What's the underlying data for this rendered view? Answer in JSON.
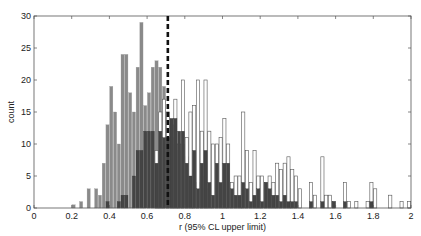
{
  "chart_data": {
    "type": "bar",
    "subtype": "overlaid-histogram",
    "title": "",
    "xlabel": "r (95% CL upper limit)",
    "ylabel": "count",
    "xlim": [
      0,
      2
    ],
    "ylim": [
      0,
      30
    ],
    "xticks": [
      0,
      0.2,
      0.4,
      0.6,
      0.8,
      1,
      1.2,
      1.4,
      1.6,
      1.8,
      2
    ],
    "xtick_labels": [
      "0",
      "0.2",
      "0.4",
      "0.6",
      "0.8",
      "1",
      "1.2",
      "1.4",
      "1.6",
      "1.8",
      "2"
    ],
    "yticks": [
      0,
      5,
      10,
      15,
      20,
      25,
      30
    ],
    "ytick_labels": [
      "0",
      "5",
      "10",
      "15",
      "20",
      "25",
      "30"
    ],
    "bin_width": 0.02,
    "grid": false,
    "vline": {
      "x": 0.71,
      "style": "dashed",
      "color": "#111111"
    },
    "series": [
      {
        "name": "light-gray",
        "color": "#8a8a8a",
        "bins": [
          [
            0.2,
            0.5
          ],
          [
            0.24,
            1
          ],
          [
            0.28,
            3
          ],
          [
            0.32,
            3
          ],
          [
            0.34,
            2
          ],
          [
            0.36,
            7
          ],
          [
            0.38,
            13
          ],
          [
            0.4,
            19
          ],
          [
            0.42,
            15
          ],
          [
            0.44,
            10
          ],
          [
            0.46,
            24
          ],
          [
            0.48,
            24
          ],
          [
            0.5,
            18
          ],
          [
            0.52,
            15
          ],
          [
            0.54,
            22
          ],
          [
            0.56,
            29
          ],
          [
            0.58,
            16
          ],
          [
            0.6,
            18
          ],
          [
            0.62,
            22
          ],
          [
            0.64,
            23
          ],
          [
            0.66,
            22
          ],
          [
            0.68,
            19
          ],
          [
            0.7,
            15
          ],
          [
            0.72,
            11
          ],
          [
            0.74,
            10
          ],
          [
            0.76,
            9
          ],
          [
            0.78,
            10
          ],
          [
            0.8,
            8
          ],
          [
            0.82,
            6
          ],
          [
            0.84,
            5
          ],
          [
            0.86,
            4
          ],
          [
            0.88,
            5
          ],
          [
            0.9,
            3
          ]
        ]
      },
      {
        "name": "white-outline",
        "color": "#ffffff",
        "bins": [
          [
            0.64,
            9
          ],
          [
            0.66,
            15
          ],
          [
            0.68,
            17
          ],
          [
            0.7,
            15
          ],
          [
            0.72,
            13
          ],
          [
            0.74,
            17
          ],
          [
            0.76,
            10
          ],
          [
            0.78,
            20
          ],
          [
            0.8,
            11
          ],
          [
            0.82,
            15
          ],
          [
            0.84,
            16
          ],
          [
            0.86,
            20
          ],
          [
            0.88,
            12
          ],
          [
            0.9,
            20
          ],
          [
            0.92,
            12
          ],
          [
            0.94,
            10
          ],
          [
            0.96,
            10
          ],
          [
            0.98,
            11
          ],
          [
            1.0,
            14
          ],
          [
            1.02,
            10
          ],
          [
            1.04,
            4
          ],
          [
            1.06,
            5
          ],
          [
            1.08,
            5
          ],
          [
            1.1,
            15
          ],
          [
            1.12,
            9
          ],
          [
            1.14,
            4
          ],
          [
            1.16,
            9
          ],
          [
            1.18,
            5
          ],
          [
            1.2,
            5
          ],
          [
            1.22,
            4
          ],
          [
            1.24,
            5
          ],
          [
            1.26,
            4
          ],
          [
            1.28,
            7
          ],
          [
            1.3,
            6
          ],
          [
            1.32,
            7
          ],
          [
            1.34,
            8
          ],
          [
            1.36,
            6
          ],
          [
            1.38,
            5
          ],
          [
            1.4,
            3
          ],
          [
            1.46,
            4
          ],
          [
            1.48,
            2
          ],
          [
            1.52,
            8
          ],
          [
            1.54,
            2
          ],
          [
            1.56,
            2
          ],
          [
            1.58,
            1
          ],
          [
            1.64,
            4
          ],
          [
            1.66,
            1
          ],
          [
            1.7,
            1
          ],
          [
            1.76,
            1
          ],
          [
            1.78,
            4
          ],
          [
            1.8,
            3
          ],
          [
            1.88,
            2
          ],
          [
            1.94,
            1
          ],
          [
            1.98,
            1
          ]
        ]
      },
      {
        "name": "dark-gray",
        "color": "#444444",
        "bins": [
          [
            0.38,
            1
          ],
          [
            0.44,
            1
          ],
          [
            0.46,
            2
          ],
          [
            0.48,
            2
          ],
          [
            0.52,
            5
          ],
          [
            0.54,
            9
          ],
          [
            0.56,
            9
          ],
          [
            0.58,
            12
          ],
          [
            0.6,
            12
          ],
          [
            0.62,
            12
          ],
          [
            0.64,
            7
          ],
          [
            0.66,
            12
          ],
          [
            0.68,
            11
          ],
          [
            0.7,
            11
          ],
          [
            0.72,
            14
          ],
          [
            0.74,
            14
          ],
          [
            0.76,
            12
          ],
          [
            0.78,
            12
          ],
          [
            0.8,
            7
          ],
          [
            0.82,
            5
          ],
          [
            0.84,
            9
          ],
          [
            0.86,
            3
          ],
          [
            0.88,
            7
          ],
          [
            0.9,
            9
          ],
          [
            0.92,
            4
          ],
          [
            0.94,
            2
          ],
          [
            0.96,
            7
          ],
          [
            0.98,
            4
          ],
          [
            1.0,
            7
          ],
          [
            1.02,
            7
          ],
          [
            1.04,
            3
          ],
          [
            1.06,
            2
          ],
          [
            1.08,
            2
          ],
          [
            1.1,
            4
          ],
          [
            1.12,
            3
          ],
          [
            1.14,
            1
          ],
          [
            1.16,
            2
          ],
          [
            1.18,
            3
          ],
          [
            1.2,
            1
          ],
          [
            1.22,
            4
          ],
          [
            1.24,
            3
          ],
          [
            1.26,
            2
          ],
          [
            1.28,
            2
          ],
          [
            1.3,
            1
          ],
          [
            1.32,
            2
          ],
          [
            1.34,
            1
          ],
          [
            1.36,
            1
          ],
          [
            1.38,
            1
          ],
          [
            1.46,
            1
          ],
          [
            1.52,
            1
          ],
          [
            1.58,
            1
          ],
          [
            1.64,
            1
          ],
          [
            1.78,
            1
          ]
        ]
      }
    ]
  }
}
